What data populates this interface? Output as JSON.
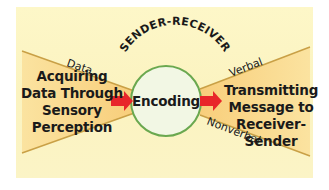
{
  "diagram": {
    "arc_title": "SENDER-RECEIVER",
    "center": {
      "label": "Encoding"
    },
    "left": {
      "lines": [
        "Acquiring",
        "Data Through",
        "Sensory",
        "Perception"
      ],
      "edge_label": "Data"
    },
    "right": {
      "lines": [
        "Transmitting",
        "Message to",
        "Receiver-Sender"
      ],
      "edge_top_label": "Verbal",
      "edge_bottom_label": "Nonverbal"
    },
    "arrows": [
      "left-arrow-into-encoding",
      "right-arrow-out-of-encoding"
    ]
  },
  "colors": {
    "background": "#fcf5c4",
    "cone_fill": "#f9d27a",
    "cone_edge": "#c9a046",
    "circle_fill": "#f2f7e4",
    "circle_stroke": "#6aa84f",
    "arrow": "#e8262a",
    "text": "#1a1a1a"
  }
}
